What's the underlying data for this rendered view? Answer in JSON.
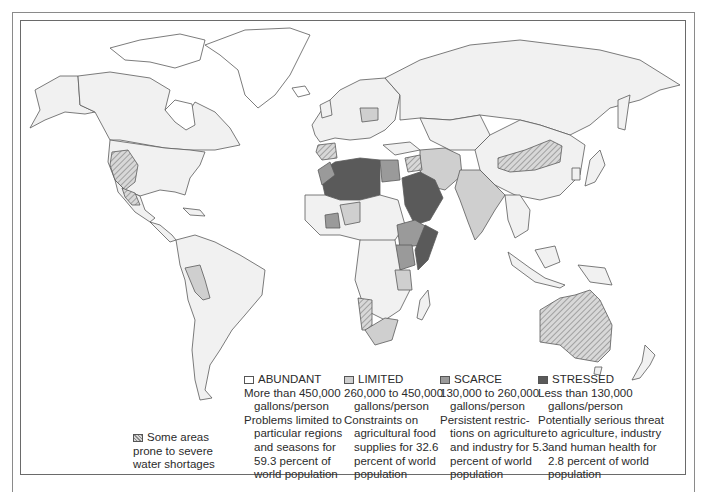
{
  "colors": {
    "abundant": "#f1f1f1",
    "limited": "#cfcfcf",
    "scarce": "#9a9a9a",
    "stressed": "#5a5a5a",
    "border": "#5b5b5b",
    "hatch": "#8a8a8a"
  },
  "legend": {
    "shortage": {
      "lines": [
        "Some areas",
        "prone to severe",
        "water shortages"
      ]
    },
    "categories": [
      {
        "key": "abundant",
        "label": "ABUNDANT",
        "lines": [
          "More than 450,000",
          "gallons/person",
          "Problems limited to",
          "particular regions",
          "and seasons for",
          "59.3 percent of",
          "world population"
        ],
        "indent": [
          false,
          true,
          false,
          true,
          true,
          true,
          true
        ]
      },
      {
        "key": "limited",
        "label": "LIMITED",
        "lines": [
          "260,000 to 450,000",
          "gallons/person",
          "Constraints on",
          "agricultural food",
          "supplies for 32.6",
          "percent of world",
          "population"
        ],
        "indent": [
          false,
          true,
          false,
          true,
          true,
          true,
          true
        ]
      },
      {
        "key": "scarce",
        "label": "SCARCE",
        "lines": [
          "130,000 to 260,000",
          "gallons/person",
          "Persistent restric-",
          "tions on agriculture",
          "and industry for 5.3",
          "percent of world",
          "population"
        ],
        "indent": [
          false,
          true,
          false,
          true,
          true,
          true,
          true
        ]
      },
      {
        "key": "stressed",
        "label": "STRESSED",
        "lines": [
          "Less than 130,000",
          "gallons/person",
          "Potentially serious threat",
          "to agriculture, industry",
          "and human health for",
          "2.8 percent of world",
          "population"
        ],
        "indent": [
          false,
          true,
          false,
          true,
          true,
          true,
          true
        ]
      }
    ]
  }
}
